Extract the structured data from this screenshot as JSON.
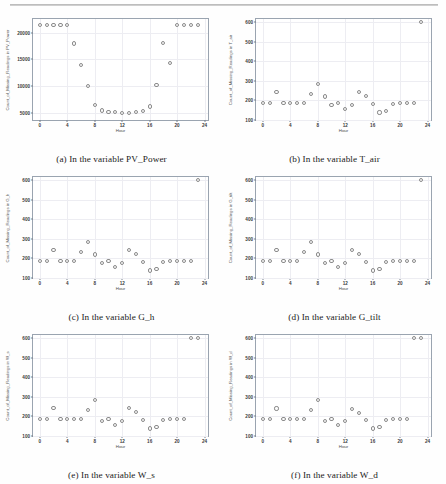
{
  "figure": {
    "xlabel": "Hour",
    "xticks": [
      0,
      4,
      8,
      12,
      16,
      20,
      24
    ],
    "xlim": [
      -1,
      24.5
    ],
    "marker_color": "#8b8b8b",
    "axis_color": "#9aa4b0",
    "grid_color": "#ededf2"
  },
  "panels": [
    {
      "caption": "(a) In the variable PV_Power",
      "chart_data": {
        "type": "scatter",
        "title": "",
        "xlabel": "Hour",
        "ylabel": "Count_of_Missing_Readings in PV_Power",
        "xlim": [
          -1,
          24.5
        ],
        "ylim": [
          3600,
          22600
        ],
        "yticks": [
          5000,
          10000,
          15000,
          20000
        ],
        "ytick_labels": [
          "5000",
          "10000",
          "15000",
          "20000"
        ],
        "grid": true,
        "legend": "none",
        "x": [
          0,
          1,
          2,
          3,
          4,
          5,
          6,
          7,
          8,
          9,
          10,
          11,
          12,
          13,
          14,
          15,
          16,
          17,
          18,
          19,
          20,
          21,
          22,
          23
        ],
        "y": [
          21500,
          21500,
          21500,
          21500,
          21400,
          18000,
          13900,
          10050,
          6350,
          5400,
          5150,
          5050,
          4900,
          4950,
          5050,
          5350,
          6150,
          10250,
          18100,
          14350,
          21500,
          21450,
          21450,
          21450
        ]
      }
    },
    {
      "caption": "(b) In the variable T_air",
      "chart_data": {
        "type": "scatter",
        "title": "",
        "xlabel": "Hour",
        "ylabel": "Count_of_Missing_Readings in T_air",
        "xlim": [
          -1,
          24.5
        ],
        "ylim": [
          100,
          615
        ],
        "yticks": [
          100,
          200,
          300,
          400,
          500,
          600
        ],
        "ytick_labels": [
          "100",
          "200",
          "300",
          "400",
          "500",
          "600"
        ],
        "grid": true,
        "legend": "none",
        "x": [
          0,
          1,
          2,
          3,
          4,
          5,
          6,
          7,
          8,
          9,
          10,
          11,
          12,
          13,
          14,
          15,
          16,
          17,
          18,
          19,
          20,
          21,
          22,
          23
        ],
        "y": [
          186,
          186,
          243,
          186,
          186,
          186,
          186,
          233,
          283,
          220,
          175,
          186,
          158,
          176,
          242,
          222,
          183,
          138,
          147,
          183,
          186,
          186,
          186,
          600
        ]
      }
    },
    {
      "caption": "(c) In the variable G_h",
      "chart_data": {
        "type": "scatter",
        "title": "",
        "xlabel": "Hour",
        "ylabel": "Count_of_Missing_Readings in G_h",
        "xlim": [
          -1,
          24.5
        ],
        "ylim": [
          100,
          615
        ],
        "yticks": [
          100,
          200,
          300,
          400,
          500,
          600
        ],
        "ytick_labels": [
          "100",
          "200",
          "300",
          "400",
          "500",
          "600"
        ],
        "grid": true,
        "legend": "none",
        "x": [
          0,
          1,
          2,
          3,
          4,
          5,
          6,
          7,
          8,
          9,
          10,
          11,
          12,
          13,
          14,
          15,
          16,
          17,
          18,
          19,
          20,
          21,
          22,
          23
        ],
        "y": [
          186,
          186,
          243,
          186,
          186,
          186,
          233,
          283,
          220,
          175,
          186,
          158,
          176,
          242,
          222,
          183,
          138,
          147,
          183,
          186,
          186,
          186,
          186,
          600
        ]
      }
    },
    {
      "caption": "(d) In the variable G_tilt",
      "chart_data": {
        "type": "scatter",
        "title": "",
        "xlabel": "Hour",
        "ylabel": "Count_of_Missing_Readings in G_tilt",
        "xlim": [
          -1,
          24.5
        ],
        "ylim": [
          100,
          615
        ],
        "yticks": [
          100,
          200,
          300,
          400,
          500,
          600
        ],
        "ytick_labels": [
          "100",
          "200",
          "300",
          "400",
          "500",
          "600"
        ],
        "grid": true,
        "legend": "none",
        "x": [
          0,
          1,
          2,
          3,
          4,
          5,
          6,
          7,
          8,
          9,
          10,
          11,
          12,
          13,
          14,
          15,
          16,
          17,
          18,
          19,
          20,
          21,
          22,
          23
        ],
        "y": [
          186,
          186,
          243,
          186,
          186,
          186,
          233,
          283,
          220,
          175,
          186,
          158,
          176,
          242,
          222,
          183,
          138,
          147,
          183,
          186,
          186,
          186,
          186,
          600
        ]
      }
    },
    {
      "caption": "(e) In the variable W_s",
      "chart_data": {
        "type": "scatter",
        "title": "",
        "xlabel": "Hour",
        "ylabel": "Count_of_Missing_Readings in W_s",
        "xlim": [
          -1,
          24.5
        ],
        "ylim": [
          100,
          615
        ],
        "yticks": [
          100,
          200,
          300,
          400,
          500,
          600
        ],
        "ytick_labels": [
          "100",
          "200",
          "300",
          "400",
          "500",
          "600"
        ],
        "grid": true,
        "legend": "none",
        "x": [
          0,
          1,
          2,
          3,
          4,
          5,
          6,
          7,
          8,
          9,
          10,
          11,
          12,
          13,
          14,
          15,
          16,
          17,
          18,
          19,
          20,
          21,
          22,
          23
        ],
        "y": [
          186,
          186,
          243,
          186,
          186,
          186,
          186,
          233,
          283,
          175,
          186,
          158,
          176,
          242,
          222,
          183,
          138,
          147,
          183,
          186,
          186,
          186,
          600,
          600
        ]
      }
    },
    {
      "caption": "(f) In the variable W_d",
      "chart_data": {
        "type": "scatter",
        "title": "",
        "xlabel": "Hour",
        "ylabel": "Count_of_Missing_Readings in W_d",
        "xlim": [
          -1,
          24.5
        ],
        "ylim": [
          100,
          615
        ],
        "yticks": [
          100,
          200,
          300,
          400,
          500,
          600
        ],
        "ytick_labels": [
          "100",
          "200",
          "300",
          "400",
          "500",
          "600"
        ],
        "grid": true,
        "legend": "none",
        "x": [
          0,
          1,
          2,
          3,
          4,
          5,
          6,
          7,
          8,
          9,
          10,
          11,
          12,
          13,
          14,
          15,
          16,
          17,
          18,
          19,
          20,
          21,
          22,
          23
        ],
        "y": [
          186,
          186,
          240,
          186,
          186,
          186,
          186,
          233,
          283,
          175,
          186,
          158,
          176,
          237,
          216,
          183,
          138,
          147,
          183,
          186,
          186,
          186,
          600,
          600
        ]
      }
    }
  ]
}
